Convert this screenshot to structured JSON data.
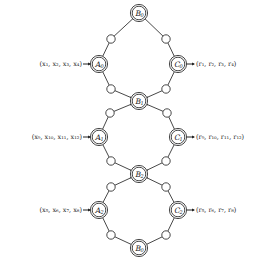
{
  "diagram": {
    "title": "",
    "colors": {
      "stroke": "#333333",
      "text": "#222222",
      "background": "#ffffff"
    },
    "main_nodes": [
      {
        "id": "B0_top",
        "letter": "B",
        "sub": "0",
        "x": 139,
        "y": 13
      },
      {
        "id": "A0",
        "letter": "A",
        "sub": "0",
        "x": 99,
        "y": 64
      },
      {
        "id": "C0",
        "letter": "C",
        "sub": "0",
        "x": 178,
        "y": 64
      },
      {
        "id": "B1",
        "letter": "B",
        "sub": "1",
        "x": 139,
        "y": 101
      },
      {
        "id": "A1",
        "letter": "A",
        "sub": "1",
        "x": 99,
        "y": 137
      },
      {
        "id": "C1",
        "letter": "C",
        "sub": "1",
        "x": 178,
        "y": 137
      },
      {
        "id": "B2",
        "letter": "B",
        "sub": "2",
        "x": 139,
        "y": 174
      },
      {
        "id": "A2",
        "letter": "A",
        "sub": "2",
        "x": 99,
        "y": 210
      },
      {
        "id": "C2",
        "letter": "C",
        "sub": "2",
        "x": 178,
        "y": 210
      },
      {
        "id": "B0_bottom",
        "letter": "B",
        "sub": "0",
        "x": 139,
        "y": 248
      }
    ],
    "small_nodes": [
      {
        "x": 111,
        "y": 39
      },
      {
        "x": 166,
        "y": 39
      },
      {
        "x": 111,
        "y": 89
      },
      {
        "x": 166,
        "y": 89
      },
      {
        "x": 110,
        "y": 113
      },
      {
        "x": 167,
        "y": 113
      },
      {
        "x": 111,
        "y": 161
      },
      {
        "x": 166,
        "y": 161
      },
      {
        "x": 111,
        "y": 187
      },
      {
        "x": 166,
        "y": 187
      },
      {
        "x": 111,
        "y": 235
      },
      {
        "x": 166,
        "y": 235
      }
    ],
    "edges": [
      [
        "B0_top",
        0
      ],
      [
        0,
        "A0"
      ],
      [
        "B0_top",
        1
      ],
      [
        1,
        "C0"
      ],
      [
        "A0",
        2
      ],
      [
        2,
        "B1"
      ],
      [
        "C0",
        3
      ],
      [
        3,
        "B1"
      ],
      [
        "B1",
        4
      ],
      [
        4,
        "A1"
      ],
      [
        "B1",
        5
      ],
      [
        5,
        "C1"
      ],
      [
        "A1",
        6
      ],
      [
        6,
        "B2"
      ],
      [
        "C1",
        7
      ],
      [
        7,
        "B2"
      ],
      [
        "B2",
        8
      ],
      [
        8,
        "A2"
      ],
      [
        "B2",
        9
      ],
      [
        9,
        "C2"
      ],
      [
        "A2",
        10
      ],
      [
        10,
        "B0_bottom"
      ],
      [
        "C2",
        11
      ],
      [
        11,
        "B0_bottom"
      ]
    ],
    "inputs": [
      {
        "target": "A0",
        "label": "(x₁, x₂, x₃, x₄)",
        "y": 64
      },
      {
        "target": "A1",
        "label": "(x₉, x₁₀, x₁₁, x₁₂)",
        "y": 137
      },
      {
        "target": "A2",
        "label": "(x₅, x₆, x₇, x₈)",
        "y": 210
      }
    ],
    "outputs": [
      {
        "source": "C0",
        "label": "(r₁, r₂, r₃, r₄)",
        "y": 64
      },
      {
        "source": "C1",
        "label": "(r₉, r₁₀, r₁₁, r₁₂)",
        "y": 137
      },
      {
        "source": "C2",
        "label": "(r₅, r₆, r₇, r₈)",
        "y": 210
      }
    ]
  }
}
